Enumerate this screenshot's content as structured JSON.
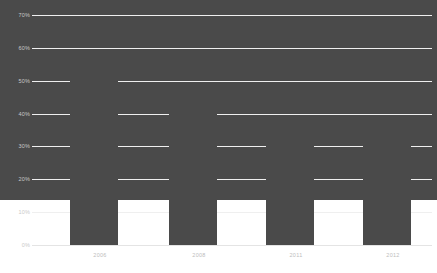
{
  "chart_data": {
    "type": "bar",
    "title": "",
    "subtitle": "",
    "xlabel": "",
    "ylabel": "",
    "categories": [
      "2006",
      "2008",
      "2011",
      "2012"
    ],
    "values": [
      61,
      58,
      43,
      37.5
    ],
    "series": [
      {
        "name": "",
        "values": [
          61,
          58,
          43,
          37.5
        ]
      }
    ],
    "ylim": [
      0,
      70
    ],
    "y_tick_labels": [
      "70%",
      "60%",
      "50%",
      "40%",
      "30%",
      "20%",
      "10%",
      "0%"
    ],
    "y_tick_values": [
      70,
      60,
      50,
      40,
      30,
      20,
      10,
      0
    ],
    "x_tick_labels": [
      "2006",
      "2008",
      "2011",
      "2012"
    ],
    "grid": true,
    "legend": false,
    "legend_position": "none",
    "colors": {
      "bar": "#4a4a4a",
      "gridline": "#efefef",
      "baseline": "#e4e4e4",
      "tick_text": "#c3c3c3",
      "background": "#ffffff"
    }
  }
}
